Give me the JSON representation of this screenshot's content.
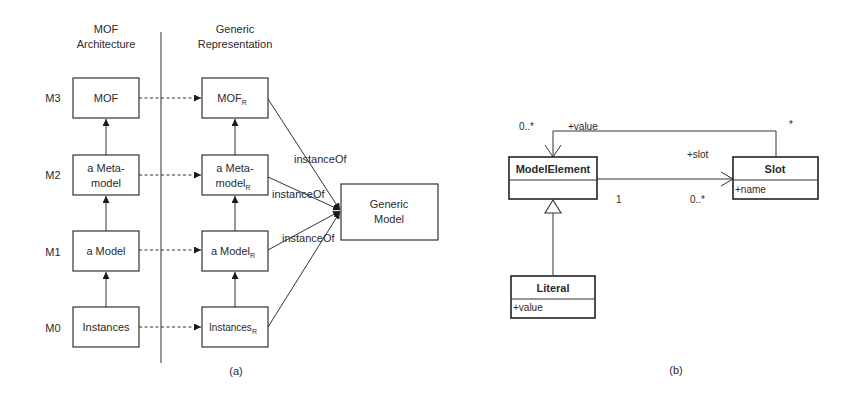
{
  "panel_a": {
    "caption": "(a)",
    "column_headers": {
      "mof_line1": "MOF",
      "mof_line2": "Architecture",
      "generic_line1": "Generic",
      "generic_line2": "Representation"
    },
    "levels": [
      "M3",
      "M2",
      "M1",
      "M0"
    ],
    "mof_boxes": {
      "m3": "MOF",
      "m2_line1": "a Meta-",
      "m2_line2": "model",
      "m1": "a Model",
      "m0": "Instances"
    },
    "generic_boxes": {
      "m3": "MOF",
      "m2_line1": "a Meta-",
      "m2_line2": "model",
      "m1": "a Model",
      "m0": "Instances",
      "subscript": "R"
    },
    "generic_model_line1": "Generic",
    "generic_model_line2": "Model",
    "edge_label": "instanceOf"
  },
  "panel_b": {
    "caption": "(b)",
    "classes": {
      "model_element": {
        "name": "ModelElement",
        "attributes": []
      },
      "slot": {
        "name": "Slot",
        "attributes": [
          "+name"
        ]
      },
      "literal": {
        "name": "Literal",
        "attributes": [
          "+value"
        ]
      }
    },
    "associations": {
      "value": {
        "role": "+value",
        "mult_target": "0..*",
        "mult_source": "*"
      },
      "slot": {
        "role": "+slot",
        "mult_source": "1",
        "mult_target": "0..*"
      }
    }
  }
}
